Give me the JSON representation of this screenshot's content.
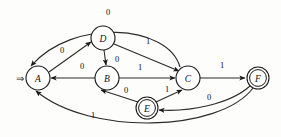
{
  "figure": {
    "kind": "finite-state-automaton-diagram",
    "start_marker": "⇒",
    "background_color": "#fdfdfb",
    "stroke_color": "#1a1a1a"
  },
  "states": [
    {
      "id": "A",
      "label": "A",
      "cx": 38,
      "cy": 78,
      "r": 12,
      "accepting": false,
      "start": true
    },
    {
      "id": "D",
      "label": "D",
      "cx": 103,
      "cy": 38,
      "r": 12,
      "accepting": false,
      "start": false
    },
    {
      "id": "B",
      "label": "B",
      "cx": 107,
      "cy": 78,
      "r": 12,
      "accepting": false,
      "start": false
    },
    {
      "id": "C",
      "label": "C",
      "cx": 188,
      "cy": 78,
      "r": 12,
      "accepting": false,
      "start": false
    },
    {
      "id": "E",
      "label": "E",
      "cx": 147,
      "cy": 108,
      "r": 11,
      "accepting": true,
      "start": false
    },
    {
      "id": "F",
      "label": "F",
      "cx": 258,
      "cy": 78,
      "r": 11,
      "accepting": true,
      "start": false
    }
  ],
  "transitions": [
    {
      "from": "C",
      "to": "A",
      "symbol": "0",
      "label_x": 108,
      "label_y": 12,
      "path": "M 180 67 C 168 24, 72 18, 31 66",
      "arrow_at": "A"
    },
    {
      "from": "A",
      "to": "D",
      "symbol": "0",
      "label_x": 62,
      "label_y": 50,
      "path": "M 49 72 L 91 42",
      "arrow_at": "D"
    },
    {
      "from": "D",
      "to": "B",
      "symbol": "0",
      "label_x": 117,
      "label_y": 59,
      "path": "M 104 50 L 106 65",
      "arrow_at": "B"
    },
    {
      "from": "B",
      "to": "A",
      "symbol": "0",
      "label_x": 82,
      "label_y": 66,
      "path": "M 95 78 L 51 78",
      "arrow_at": "A"
    },
    {
      "from": "D",
      "to": "C",
      "symbol": "1",
      "label_x": 148,
      "label_y": 41,
      "path": "M 114 44 L 179 71",
      "arrow_at": "C"
    },
    {
      "from": "B",
      "to": "C",
      "symbol": "1",
      "label_x": 140,
      "label_y": 67,
      "path": "M 119 78 L 175 78",
      "arrow_at": "C"
    },
    {
      "from": "C",
      "to": "F",
      "symbol": "1",
      "label_x": 222,
      "label_y": 65,
      "path": "M 200 78 L 245 78",
      "arrow_at": "F"
    },
    {
      "from": "E",
      "to": "B",
      "symbol": "0",
      "label_x": 126,
      "label_y": 90,
      "path": "M 138 102 L 101 90",
      "arrow_at": "B"
    },
    {
      "from": "E",
      "to": "C",
      "symbol": "1",
      "label_x": 167,
      "label_y": 89,
      "path": "M 156 102 L 182 90",
      "arrow_at": "C"
    },
    {
      "from": "F",
      "to": "E",
      "symbol": "0",
      "label_x": 209,
      "label_y": 97,
      "path": "M 250 86 C 230 104, 190 112, 159 110",
      "arrow_at": "E"
    },
    {
      "from": "F",
      "to": "A",
      "symbol": "1",
      "label_x": 93,
      "label_y": 115,
      "path": "M 253 88 C 220 132, 90 136, 36 91",
      "arrow_at": "A"
    }
  ],
  "labels": {
    "node_A": "A",
    "node_B": "B",
    "node_C": "C",
    "node_D": "D",
    "node_E": "E",
    "node_F": "F"
  }
}
